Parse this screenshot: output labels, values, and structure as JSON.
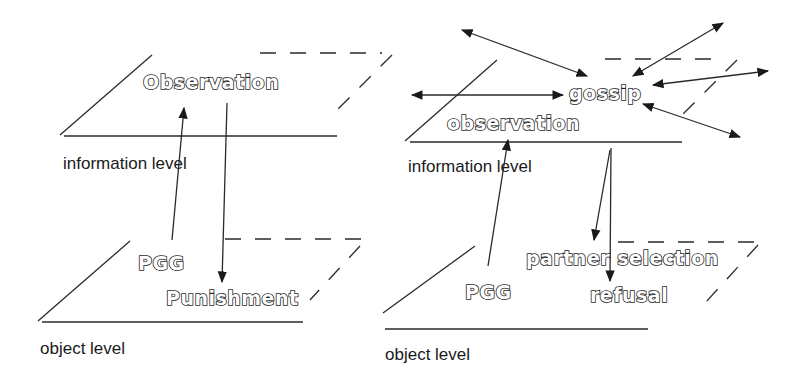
{
  "left_panel": {
    "info_plane": {
      "label": "information level",
      "node": "Observation"
    },
    "object_plane": {
      "label": "object level",
      "nodes": [
        "PGG",
        "Punishment"
      ]
    },
    "arrows": [
      {
        "from": "PGG",
        "to": "Observation"
      },
      {
        "from": "Observation",
        "to": "Punishment"
      }
    ]
  },
  "right_panel": {
    "info_plane": {
      "label": "information level",
      "nodes": [
        "gossip",
        "observation"
      ]
    },
    "object_plane": {
      "label": "object level",
      "nodes": [
        "PGG",
        "partner selection",
        "refusal"
      ]
    },
    "arrows": [
      {
        "from": "PGG",
        "to": "observation"
      },
      {
        "from": "observation",
        "to": "partner selection"
      },
      {
        "from": "observation",
        "to": "refusal"
      },
      {
        "between": "gossip",
        "and": "external",
        "count": 5,
        "bidirectional": true
      }
    ]
  },
  "colors": {
    "line": "#2a2a2a",
    "background": "#ffffff",
    "text_fill": "#ffffff"
  }
}
